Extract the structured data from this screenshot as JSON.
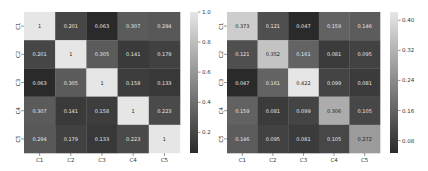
{
  "chart_data": [
    {
      "type": "heatmap",
      "title": "",
      "xlabel": "",
      "ylabel": "",
      "x_categories": [
        "C1",
        "C2",
        "C3",
        "C4",
        "C5"
      ],
      "y_categories": [
        "C1",
        "C2",
        "C3",
        "C4",
        "C5"
      ],
      "values": [
        [
          1,
          0.201,
          0.063,
          0.307,
          0.294
        ],
        [
          0.201,
          1,
          0.305,
          0.141,
          0.179
        ],
        [
          0.063,
          0.305,
          1,
          0.158,
          0.133
        ],
        [
          0.307,
          0.141,
          0.158,
          1,
          0.223
        ],
        [
          0.294,
          0.179,
          0.133,
          0.223,
          1
        ]
      ],
      "labels": [
        [
          "1",
          "0.201",
          "0.063",
          "0.307",
          "0.294"
        ],
        [
          "0.201",
          "1",
          "0.305",
          "0.141",
          "0.179"
        ],
        [
          "0.063",
          "0.305",
          "1",
          "0.158",
          "0.133"
        ],
        [
          "0.307",
          "0.141",
          "0.158",
          "1",
          "0.223"
        ],
        [
          "0.294",
          "0.179",
          "0.133",
          "0.223",
          "1"
        ]
      ],
      "colormap": "grayscale",
      "color_low": "#2a2a2a",
      "color_high": "#e6e6e6",
      "vmin": 0.063,
      "vmax": 1.0,
      "colorbar": {
        "ticks": [
          0.2,
          0.4,
          0.6,
          0.8,
          1.0
        ],
        "tick_labels": [
          "0.2",
          "0.4",
          "0.6",
          "0.8",
          "1.0"
        ],
        "placement": "right"
      }
    },
    {
      "type": "heatmap",
      "title": "",
      "xlabel": "",
      "ylabel": "",
      "x_categories": [
        "C1",
        "C2",
        "C3",
        "C4",
        "C5"
      ],
      "y_categories": [
        "C1",
        "C2",
        "C3",
        "C4",
        "C5"
      ],
      "values": [
        [
          0.373,
          0.121,
          0.047,
          0.159,
          0.146
        ],
        [
          0.121,
          0.352,
          0.161,
          0.081,
          0.095
        ],
        [
          0.047,
          0.161,
          0.422,
          0.099,
          0.081
        ],
        [
          0.159,
          0.081,
          0.099,
          0.306,
          0.105
        ],
        [
          0.146,
          0.095,
          0.081,
          0.105,
          0.272
        ]
      ],
      "labels": [
        [
          "0.373",
          "0.121",
          "0.047",
          "0.159",
          "0.146"
        ],
        [
          "0.121",
          "0.352",
          "0.161",
          "0.081",
          "0.095"
        ],
        [
          "0.047",
          "0.161",
          "0.422",
          "0.099",
          "0.081"
        ],
        [
          "0.159",
          "0.081",
          "0.099",
          "0.306",
          "0.105"
        ],
        [
          "0.146",
          "0.095",
          "0.081",
          "0.105",
          "0.272"
        ]
      ],
      "colormap": "grayscale",
      "color_low": "#2a2a2a",
      "color_high": "#e6e6e6",
      "vmin": 0.047,
      "vmax": 0.422,
      "colorbar": {
        "ticks": [
          0.08,
          0.16,
          0.24,
          0.32,
          0.4
        ],
        "tick_labels": [
          "0.08",
          "0.16",
          "0.24",
          "0.32",
          "0.40"
        ],
        "placement": "right"
      }
    }
  ]
}
